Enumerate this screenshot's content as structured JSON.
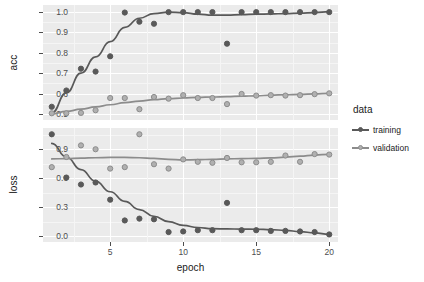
{
  "chart_data": {
    "type": "scatter",
    "title": "",
    "xlabel": "epoch",
    "ylabel": "",
    "facets": [
      {
        "name": "acc",
        "ylabel": "acc",
        "ylim": [
          0.47,
          1.035
        ],
        "yticks": [
          0.5,
          0.6,
          0.7,
          0.8,
          0.9,
          1.0
        ],
        "ytick_labels": [
          "0.5",
          "0.6",
          "0.7",
          "0.8",
          "0.9",
          "1.0"
        ],
        "series": [
          {
            "name": "training",
            "color": "#595959",
            "x": [
              1,
              2,
              3,
              4,
              5,
              6,
              7,
              8,
              9,
              10,
              11,
              12,
              13,
              14,
              15,
              16,
              17,
              18,
              19,
              20
            ],
            "values": [
              0.535,
              0.615,
              0.722,
              0.708,
              0.783,
              0.998,
              0.953,
              0.943,
              1.0,
              1.0,
              1.0,
              1.0,
              0.845,
              1.0,
              1.0,
              1.0,
              1.0,
              1.0,
              1.0,
              1.0
            ],
            "smooth": [
              0.505,
              0.603,
              0.7,
              0.78,
              0.855,
              0.925,
              0.97,
              0.993,
              1.0,
              0.998,
              0.99,
              0.985,
              0.985,
              0.988,
              0.99,
              0.991,
              0.993,
              0.995,
              0.998,
              1.002
            ]
          },
          {
            "name": "validation",
            "color": "#8c8c8c",
            "x": [
              1,
              2,
              3,
              4,
              5,
              6,
              7,
              8,
              9,
              10,
              11,
              12,
              13,
              14,
              15,
              16,
              17,
              18,
              19,
              20
            ],
            "values": [
              0.503,
              0.503,
              0.505,
              0.518,
              0.578,
              0.578,
              0.523,
              0.583,
              0.575,
              0.592,
              0.578,
              0.578,
              0.548,
              0.598,
              0.59,
              0.592,
              0.59,
              0.592,
              0.597,
              0.601
            ],
            "smooth": [
              0.5,
              0.512,
              0.523,
              0.534,
              0.545,
              0.555,
              0.563,
              0.57,
              0.575,
              0.578,
              0.581,
              0.583,
              0.585,
              0.587,
              0.589,
              0.592,
              0.594,
              0.596,
              0.598,
              0.601
            ]
          }
        ]
      },
      {
        "name": "loss",
        "ylabel": "loss",
        "ylim": [
          -0.06,
          1.12
        ],
        "yticks": [
          0.0,
          0.3,
          0.6,
          0.9
        ],
        "ytick_labels": [
          "0.0",
          "0.3",
          "0.6",
          "0.9"
        ],
        "series": [
          {
            "name": "training",
            "color": "#595959",
            "x": [
              1,
              2,
              3,
              4,
              5,
              6,
              7,
              8,
              9,
              10,
              11,
              12,
              13,
              14,
              15,
              16,
              17,
              18,
              19,
              20
            ],
            "values": [
              1.055,
              0.607,
              0.535,
              0.556,
              0.378,
              0.163,
              0.182,
              0.175,
              0.043,
              0.049,
              0.062,
              0.062,
              0.345,
              0.062,
              0.062,
              0.055,
              0.055,
              0.049,
              0.043,
              0.018
            ],
            "smooth": [
              0.96,
              0.82,
              0.69,
              0.57,
              0.46,
              0.36,
              0.276,
              0.205,
              0.15,
              0.112,
              0.09,
              0.078,
              0.075,
              0.074,
              0.072,
              0.068,
              0.06,
              0.048,
              0.034,
              0.018
            ]
          },
          {
            "name": "validation",
            "color": "#8c8c8c",
            "x": [
              1,
              2,
              3,
              4,
              5,
              6,
              7,
              8,
              9,
              10,
              11,
              12,
              13,
              14,
              15,
              16,
              17,
              18,
              19,
              20
            ],
            "values": [
              0.715,
              0.82,
              0.94,
              0.9,
              0.7,
              0.715,
              1.055,
              0.745,
              0.7,
              0.795,
              0.77,
              0.76,
              0.81,
              0.765,
              0.765,
              0.77,
              0.835,
              0.77,
              0.85,
              0.845
            ],
            "smooth": [
              0.8,
              0.803,
              0.808,
              0.812,
              0.815,
              0.815,
              0.812,
              0.805,
              0.795,
              0.79,
              0.792,
              0.796,
              0.8,
              0.803,
              0.806,
              0.81,
              0.818,
              0.828,
              0.84,
              0.848
            ]
          }
        ]
      }
    ],
    "xlim": [
      0.4,
      20.6
    ],
    "xticks": [
      5,
      10,
      15,
      20
    ],
    "xtick_labels": [
      "5",
      "10",
      "15",
      "20"
    ],
    "grid": true,
    "legend_position": "right"
  },
  "legend": {
    "title": "data",
    "entries": [
      {
        "label": "training",
        "color": "#595959"
      },
      {
        "label": "validation",
        "color": "#8c8c8c"
      }
    ]
  },
  "theme": {
    "panel_background": "#ebebeb",
    "grid_major": "#ffffff",
    "grid_minor": "#f5f5f5",
    "text_color": "#1a1a1a",
    "tick_color": "#4d4d4d"
  }
}
